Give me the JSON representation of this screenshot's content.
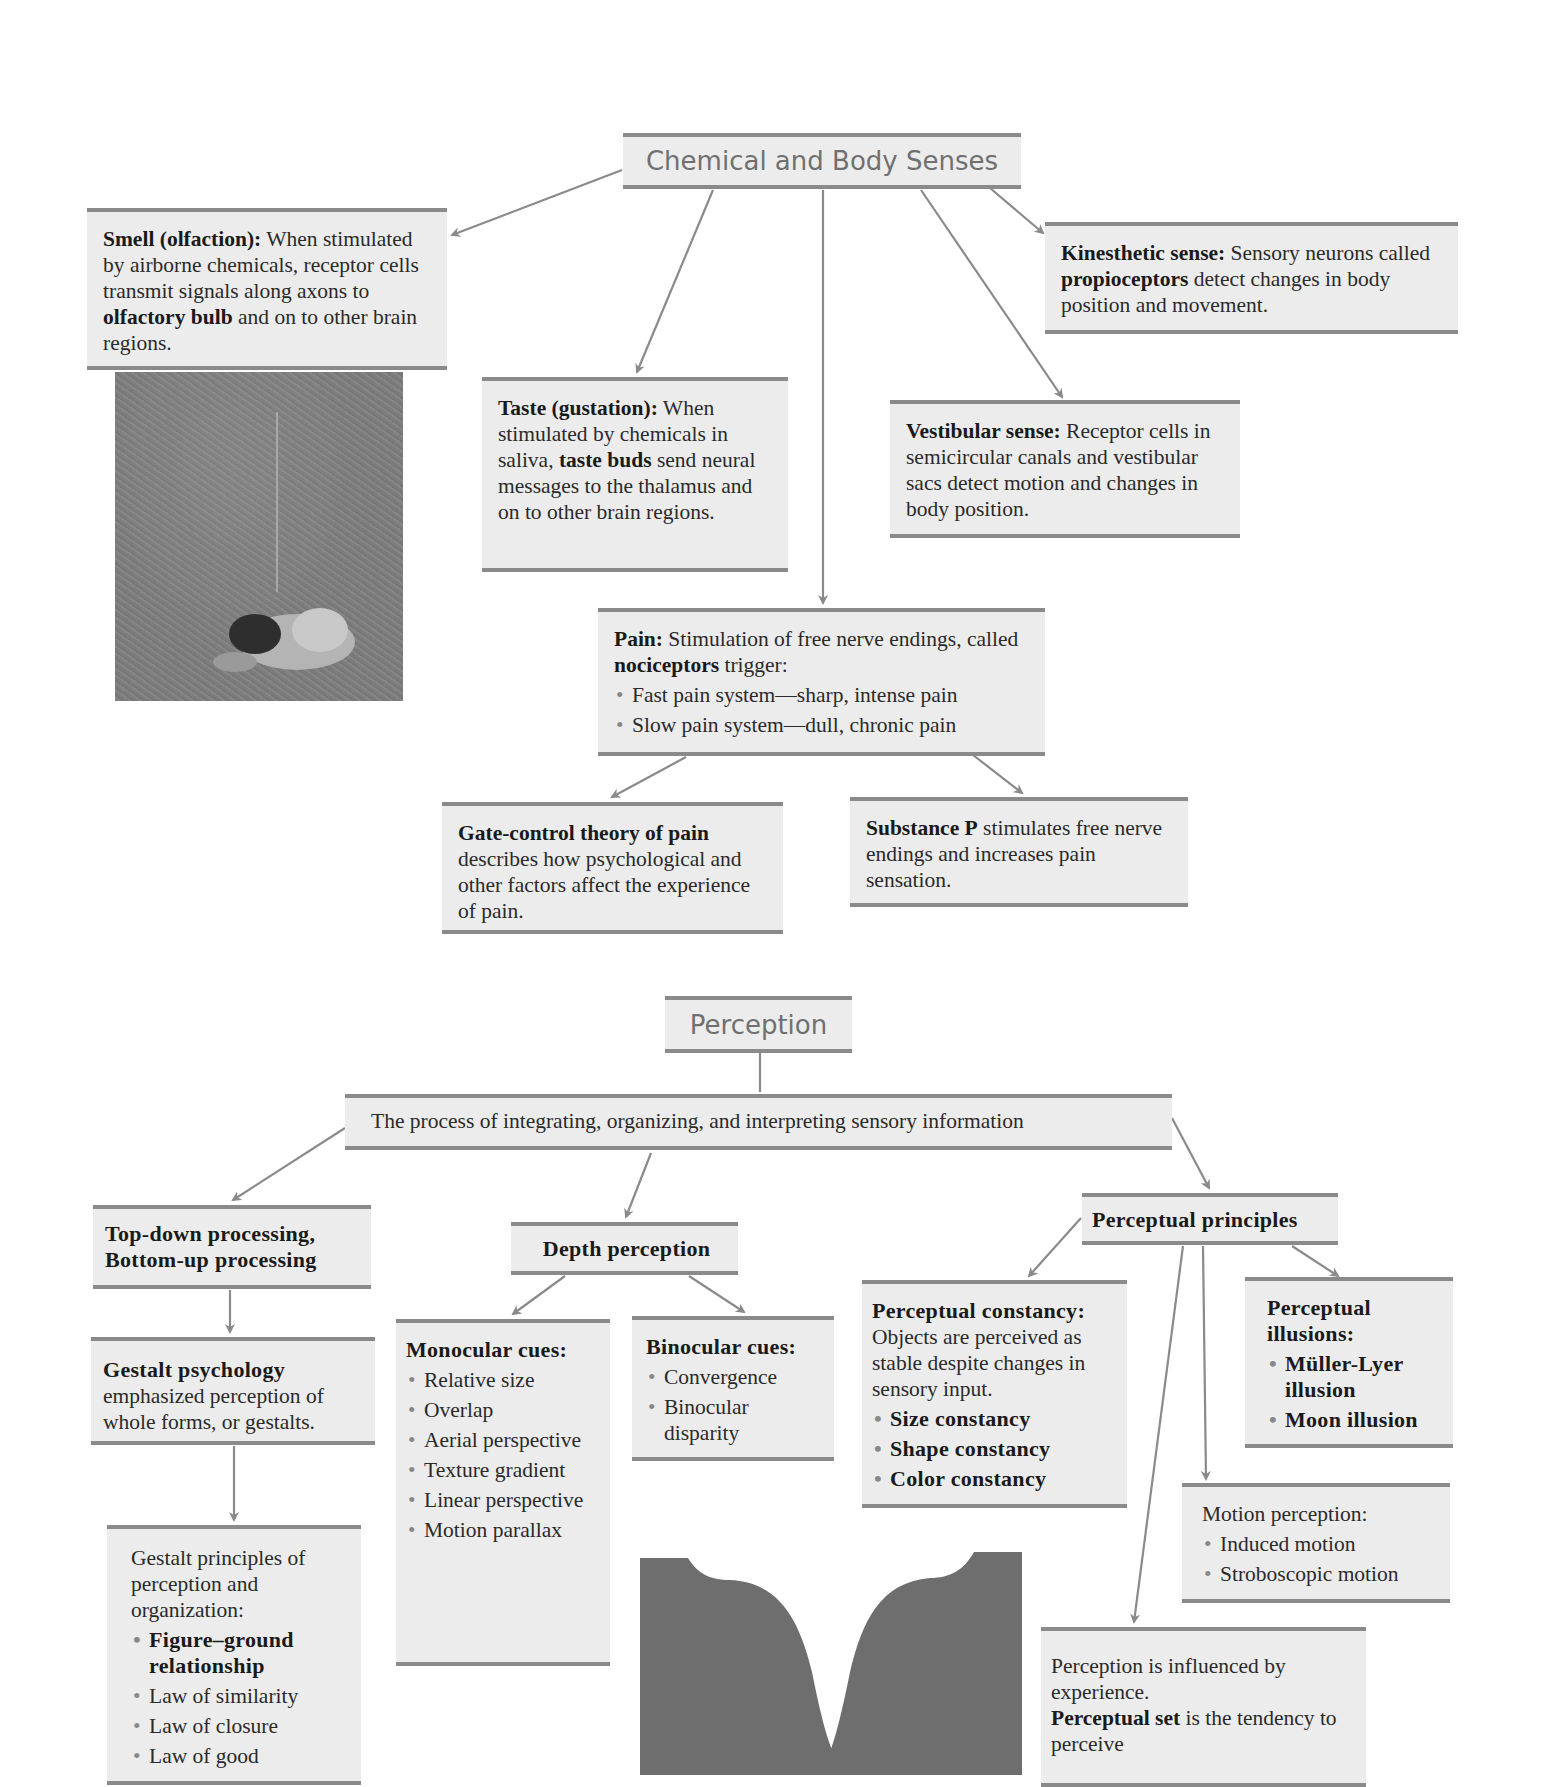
{
  "chemical": {
    "title": "Chemical and Body Senses",
    "smell": {
      "heading": "Smell (olfaction):",
      "text1": " When stimulated by airborne chemicals, receptor cells transmit signals along axons to ",
      "bold2": "olfactory bulb",
      "text2": " and on to other brain regions."
    },
    "photo_label": "person-smelling-grass-photo",
    "taste": {
      "heading": "Taste (gustation):",
      "text1": " When stimulated by chemicals in saliva, ",
      "bold2": "taste buds",
      "text2": " send neural messages to the thalamus and on to other brain regions."
    },
    "kinesthetic": {
      "heading": "Kinesthetic sense:",
      "text1": " Sensory neurons called ",
      "bold2": "propioceptors",
      "text2": " detect changes in body position and movement."
    },
    "vestibular": {
      "heading": "Vestibular sense:",
      "text1": " Receptor cells in semicircular canals and vestibular sacs detect motion and changes in body position."
    },
    "pain": {
      "heading": "Pain:",
      "text1": " Stimulation of free nerve endings, called ",
      "bold2": "nociceptors",
      "text2": " trigger:",
      "items": [
        "Fast pain system—sharp, intense pain",
        "Slow pain system—dull, chronic pain"
      ]
    },
    "gate_control": {
      "heading": "Gate-control theory of pain",
      "text1": " describes how psychological and other factors affect the experience of pain."
    },
    "substance_p": {
      "heading": "Substance P",
      "text1": " stimulates free nerve endings and increases pain sensation."
    }
  },
  "perception": {
    "title": "Perception",
    "definition": "The process of integrating, organizing, and interpreting sensory information",
    "top_down": {
      "line1": "Top-down processing,",
      "line2": "Bottom-up processing"
    },
    "gestalt_psych": {
      "heading": "Gestalt psychology",
      "text1": " emphasized perception of whole forms, or gestalts."
    },
    "gestalt_principles": {
      "intro": "Gestalt principles of perception and organization:",
      "bold_item": "Figure–ground relationship",
      "items": [
        "Law of similarity",
        "Law of closure",
        "Law of good"
      ]
    },
    "depth": {
      "title": "Depth perception",
      "monocular": {
        "heading": "Monocular cues:",
        "items": [
          "Relative size",
          "Overlap",
          "Aerial perspective",
          "Texture gradient",
          "Linear perspective",
          "Motion parallax"
        ]
      },
      "binocular": {
        "heading": "Binocular cues:",
        "items": [
          "Convergence",
          "Binocular disparity"
        ]
      }
    },
    "faces_label": "figure-ground-faces-vase-illustration",
    "principles": {
      "title": "Perceptual principles",
      "constancy": {
        "heading": "Perceptual constancy:",
        "text1": " Objects are perceived as stable despite changes in sensory input.",
        "items": [
          "Size constancy",
          "Shape constancy",
          "Color constancy"
        ]
      },
      "illusions": {
        "heading": "Perceptual illusions:",
        "items": [
          "Müller-Lyer illusion",
          "Moon illusion"
        ]
      },
      "motion": {
        "heading": "Motion perception:",
        "items": [
          "Induced motion",
          "Stroboscopic motion"
        ]
      },
      "experience": {
        "text1": "Perception is influenced by experience.",
        "bold2": "Perceptual set",
        "text2": " is the tendency to perceive"
      }
    }
  },
  "colors": {
    "box_bg": "#ececec",
    "rule": "#8a8a8a",
    "arrow": "#8a8a8a",
    "title_text": "#707070",
    "silhouette": "#6e6e6e"
  }
}
